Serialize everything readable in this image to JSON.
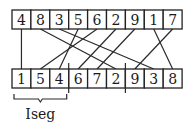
{
  "diagram": {
    "top_row": {
      "values": [
        "4",
        "8",
        "3",
        "5",
        "6",
        "2",
        "9",
        "1",
        "7"
      ]
    },
    "bottom_row": {
      "values": [
        "1",
        "5",
        "4",
        "6",
        "7",
        "2",
        "9",
        "3",
        "8"
      ]
    },
    "connections": [
      {
        "from_top_index": 0,
        "to_bottom_index": 0
      },
      {
        "from_top_index": 1,
        "to_bottom_index": 5
      },
      {
        "from_top_index": 2,
        "to_bottom_index": 7
      },
      {
        "from_top_index": 3,
        "to_bottom_index": 2
      },
      {
        "from_top_index": 4,
        "to_bottom_index": 1
      },
      {
        "from_top_index": 5,
        "to_bottom_index": 3
      },
      {
        "from_top_index": 6,
        "to_bottom_index": 4
      },
      {
        "from_top_index": 7,
        "to_bottom_index": 8
      },
      {
        "from_top_index": 8,
        "to_bottom_index": 6
      }
    ],
    "dividers_after_bottom_index": [
      2,
      5
    ],
    "bracket": {
      "label": "Iseg",
      "spans_bottom_indices": [
        0,
        2
      ]
    },
    "colors": {
      "stroke": "#222222",
      "background": "#ffffff"
    }
  }
}
